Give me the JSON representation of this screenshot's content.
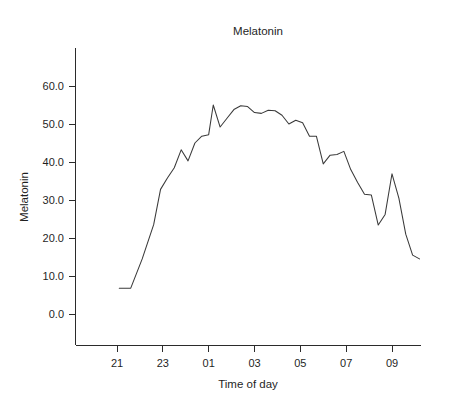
{
  "chart_data": {
    "type": "line",
    "title": "Melatonin",
    "xlabel": "Time of day",
    "ylabel": "Melatonin",
    "grid": false,
    "legend": null,
    "xlim": [
      20.2,
      9.6
    ],
    "ylim": [
      0.0,
      68.0
    ],
    "x_tick_labels": [
      "21",
      "23",
      "01",
      "03",
      "05",
      "07",
      "09"
    ],
    "x_tick_hours": [
      21,
      23,
      25,
      27,
      29,
      31,
      33
    ],
    "y_tick_labels": [
      "0.0",
      "10.0",
      "20.0",
      "30.0",
      "40.0",
      "50.0",
      "60.0"
    ],
    "y_tick_values": [
      0.0,
      10.0,
      20.0,
      30.0,
      40.0,
      50.0,
      60.0
    ],
    "series": [
      {
        "name": "Melatonin",
        "x": [
          21.1,
          21.6,
          22.1,
          22.6,
          22.9,
          23.2,
          23.5,
          23.8,
          24.1,
          24.4,
          24.7,
          25.0,
          25.2,
          25.5,
          25.8,
          26.1,
          26.4,
          26.7,
          27.0,
          27.3,
          27.6,
          27.9,
          28.2,
          28.5,
          28.8,
          29.1,
          29.4,
          29.7,
          30.0,
          30.3,
          30.6,
          30.9,
          31.2,
          31.5,
          31.8,
          32.1,
          32.4,
          32.7,
          33.0,
          33.3
        ],
        "y": [
          6.8,
          6.8,
          14.5,
          23.5,
          32.8,
          35.8,
          38.5,
          43.2,
          40.3,
          45.0,
          46.8,
          47.2,
          55.0,
          49.2,
          51.5,
          53.8,
          54.8,
          54.6,
          53.0,
          52.8,
          53.6,
          53.5,
          52.3,
          50.0,
          51.0,
          50.3,
          46.8,
          46.8,
          39.5,
          41.8,
          42.0,
          42.8,
          38.0,
          34.6,
          31.5,
          31.3,
          23.4,
          26.2,
          36.9,
          30.5
        ],
        "y_end_tail": [
          21.0,
          15.5,
          14.5
        ]
      }
    ],
    "units": ""
  },
  "chart": {
    "title": "Melatonin",
    "x_axis_title": "Time of day",
    "y_axis_title": "Melatonin"
  }
}
